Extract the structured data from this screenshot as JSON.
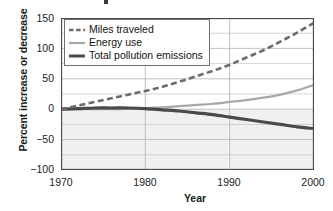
{
  "chart_data": {
    "type": "line",
    "title": "",
    "xlabel": "Year",
    "ylabel": "Percent increase or decrease",
    "xlim": [
      1970,
      2000
    ],
    "ylim": [
      -100,
      150
    ],
    "xticks": [
      1970,
      1980,
      1990,
      2000
    ],
    "yticks": [
      150,
      100,
      50,
      0,
      -50,
      -100
    ],
    "grid": true,
    "grid_minor_step": 25,
    "legend_position": "top-left",
    "x": [
      1970,
      1972,
      1974,
      1976,
      1978,
      1980,
      1982,
      1984,
      1986,
      1988,
      1990,
      1992,
      1994,
      1996,
      1998,
      2000
    ],
    "series": [
      {
        "name": "Miles traveled",
        "style": "dashed",
        "color": "#6b6b6b",
        "values": [
          0,
          6,
          12,
          18,
          24,
          30,
          37,
          45,
          54,
          63,
          73,
          85,
          97,
          111,
          126,
          142
        ]
      },
      {
        "name": "Energy use",
        "style": "solid-light",
        "color": "#a8a8a8",
        "values": [
          0,
          0,
          0,
          0,
          1,
          2,
          3,
          5,
          7,
          9,
          12,
          15,
          19,
          24,
          31,
          40
        ]
      },
      {
        "name": "Total pollution emissions",
        "style": "solid-bold",
        "color": "#4a4a4a",
        "values": [
          0,
          1,
          2,
          2,
          2,
          1,
          -1,
          -3,
          -6,
          -9,
          -13,
          -17,
          -21,
          -25,
          -29,
          -32
        ]
      }
    ]
  },
  "axis": {
    "y_label": "Percent increase or decrease",
    "x_label": "Year",
    "y_ticks": [
      "150",
      "100",
      "50",
      "0",
      "−50",
      "−100"
    ],
    "x_ticks": [
      "1970",
      "1980",
      "1990",
      "2000"
    ]
  },
  "legend": {
    "items": [
      {
        "label": "Miles traveled",
        "swatch": "dashed-line-swatch"
      },
      {
        "label": "Energy use",
        "swatch": "light-solid-line-swatch"
      },
      {
        "label": "Total pollution emissions",
        "swatch": "bold-solid-line-swatch"
      }
    ]
  },
  "colors": {
    "miles_traveled": "#6b6b6b",
    "energy_use": "#a8a8a8",
    "pollution": "#4a4a4a",
    "grid": "#b9b9b9",
    "frame": "#4d4d4d",
    "text": "#1b1b1b",
    "negative_band": "#ebebeb"
  }
}
